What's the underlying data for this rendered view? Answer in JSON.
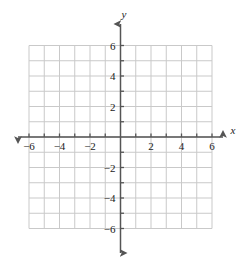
{
  "figure": {
    "type": "cartesian-grid",
    "title": "",
    "background_color": "#ffffff"
  },
  "chart_data": {
    "type": "scatter",
    "title": "",
    "subtitle": "",
    "xlabel": "x",
    "ylabel": "y",
    "xlim": [
      -6,
      6
    ],
    "ylim": [
      -6,
      6
    ],
    "xticks": [
      -6,
      -4,
      -2,
      2,
      4,
      6
    ],
    "yticks": [
      -6,
      -4,
      -2,
      2,
      4,
      6
    ],
    "xtick_labels": [
      "-6",
      "-4",
      "-2",
      "2",
      "4",
      "6"
    ],
    "ytick_labels": [
      "-6",
      "-4",
      "-2",
      "2",
      "4",
      "6"
    ],
    "minor_tick_step": 1,
    "grid": true,
    "grid_color": "#c9c9c9",
    "axis_color": "#555555",
    "legend": null,
    "series": [],
    "annotations": [],
    "x": [],
    "values": []
  },
  "axes": {
    "x_axis": {
      "label": "x",
      "label_style": "italic",
      "arrow_start": true,
      "arrow_end": true
    },
    "y_axis": {
      "label": "y",
      "label_style": "italic",
      "arrow_start": true,
      "arrow_end": true
    }
  },
  "x_tick_labels": [
    {
      "value": -6,
      "text": "-6"
    },
    {
      "value": -4,
      "text": "-4"
    },
    {
      "value": -2,
      "text": "-2"
    },
    {
      "value": 2,
      "text": "2"
    },
    {
      "value": 4,
      "text": "4"
    },
    {
      "value": 6,
      "text": "6"
    }
  ],
  "y_tick_labels": [
    {
      "value": 6,
      "text": "6"
    },
    {
      "value": 4,
      "text": "4"
    },
    {
      "value": 2,
      "text": "2"
    },
    {
      "value": -2,
      "text": "-2"
    },
    {
      "value": -4,
      "text": "-4"
    },
    {
      "value": -6,
      "text": "-6"
    }
  ]
}
